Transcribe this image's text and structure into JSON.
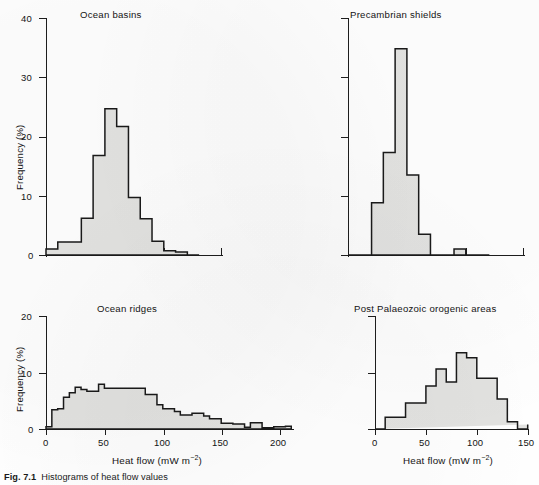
{
  "figure": {
    "caption_prefix": "Fig. 7.1",
    "caption_text": "Histograms of heat flow values",
    "y_axis_label": "Frequency (%)",
    "x_axis_label_main": "Heat flow (mW m",
    "x_axis_label_exp": "−2",
    "x_axis_label_close": ")"
  },
  "panels": [
    {
      "id": "ocean-basins",
      "title": "Ocean basins",
      "show_y_label": true,
      "show_x_label": false,
      "y_ticks": [
        {
          "value": 0,
          "label": "0"
        },
        {
          "value": 10,
          "label": "10"
        },
        {
          "value": 20,
          "label": "20"
        },
        {
          "value": 30,
          "label": "30"
        },
        {
          "value": 40,
          "label": "40"
        }
      ],
      "x_ticks": [
        {
          "value": 0,
          "label": ""
        },
        {
          "value": 50,
          "label": ""
        },
        {
          "value": 100,
          "label": ""
        },
        {
          "value": 150,
          "label": ""
        }
      ]
    },
    {
      "id": "precambrian-shields",
      "title": "Precambrian shields",
      "show_y_label": false,
      "show_x_label": false,
      "y_ticks": [
        {
          "value": 0,
          "label": ""
        },
        {
          "value": 10,
          "label": ""
        },
        {
          "value": 20,
          "label": ""
        },
        {
          "value": 30,
          "label": ""
        },
        {
          "value": 40,
          "label": ""
        }
      ],
      "x_ticks": [
        {
          "value": 0,
          "label": ""
        },
        {
          "value": 50,
          "label": ""
        },
        {
          "value": 100,
          "label": ""
        },
        {
          "value": 150,
          "label": ""
        }
      ]
    },
    {
      "id": "ocean-ridges",
      "title": "Ocean ridges",
      "show_y_label": true,
      "show_x_label": true,
      "y_ticks": [
        {
          "value": 0,
          "label": "0"
        },
        {
          "value": 10,
          "label": "10"
        },
        {
          "value": 20,
          "label": "20"
        }
      ],
      "x_ticks": [
        {
          "value": 0,
          "label": "0"
        },
        {
          "value": 50,
          "label": "50"
        },
        {
          "value": 100,
          "label": "100"
        },
        {
          "value": 150,
          "label": "150"
        },
        {
          "value": 200,
          "label": "200"
        }
      ]
    },
    {
      "id": "post-palaeozoic-orogenic-areas",
      "title": "Post Palaeozoic orogenic areas",
      "show_y_label": false,
      "show_x_label": true,
      "y_ticks": [
        {
          "value": 0,
          "label": ""
        },
        {
          "value": 10,
          "label": ""
        },
        {
          "value": 20,
          "label": ""
        }
      ],
      "x_ticks": [
        {
          "value": 0,
          "label": "0"
        },
        {
          "value": 50,
          "label": "50"
        },
        {
          "value": 100,
          "label": "100"
        },
        {
          "value": 150,
          "label": "150"
        }
      ]
    }
  ],
  "chart_data": [
    {
      "type": "bar",
      "id": "ocean-basins",
      "title": "Ocean basins",
      "xlabel": "Heat flow (mW m-2)",
      "ylabel": "Frequency (%)",
      "xlim": [
        0,
        190
      ],
      "ylim": [
        0,
        40
      ],
      "bin_width": 10,
      "bin_edges": [
        0,
        10,
        20,
        30,
        40,
        50,
        60,
        70,
        80,
        90,
        100,
        110,
        120,
        130
      ],
      "values": [
        1.0,
        2.2,
        2.2,
        6.2,
        16.8,
        24.7,
        21.7,
        9.7,
        6.1,
        2.3,
        0.7,
        0.5,
        0.0
      ],
      "grid": false,
      "legend": null
    },
    {
      "type": "bar",
      "id": "precambrian-shields",
      "title": "Precambrian shields",
      "xlabel": "Heat flow (mW m-2)",
      "ylabel": "Frequency (%)",
      "xlim": [
        0,
        150
      ],
      "ylim": [
        0,
        40
      ],
      "bin_width": 10,
      "bin_edges": [
        0,
        10,
        20,
        30,
        40,
        50,
        60,
        70,
        80,
        90,
        100,
        110,
        120
      ],
      "values": [
        0.0,
        0.0,
        8.8,
        17.3,
        34.8,
        13.5,
        3.5,
        0.0,
        0.0,
        1.0,
        0.0,
        0.0
      ],
      "grid": false,
      "legend": null
    },
    {
      "type": "bar",
      "id": "ocean-ridges",
      "title": "Ocean ridges",
      "xlabel": "Heat flow (mW m-2)",
      "ylabel": "Frequency (%)",
      "xlim": [
        0,
        215
      ],
      "ylim": [
        0,
        20
      ],
      "bin_width": 10,
      "bin_edges": [
        0,
        5,
        10,
        15,
        20,
        25,
        30,
        35,
        40,
        45,
        50,
        55,
        60,
        65,
        70,
        75,
        80,
        85,
        90,
        95,
        100,
        105,
        110,
        115,
        120,
        125,
        130,
        135,
        140,
        145,
        150,
        155,
        160,
        165,
        170,
        175,
        180,
        185,
        190,
        195,
        200,
        205,
        210
      ],
      "values": [
        0.4,
        3.4,
        3.6,
        5.6,
        6.4,
        7.4,
        7.0,
        6.7,
        6.7,
        7.9,
        7.2,
        7.2,
        7.2,
        7.2,
        7.2,
        7.2,
        7.2,
        6.1,
        6.1,
        4.3,
        3.6,
        3.6,
        3.1,
        2.5,
        2.5,
        2.8,
        2.8,
        2.3,
        1.8,
        1.8,
        1.0,
        1.0,
        0.9,
        0.9,
        0.3,
        1.1,
        1.1,
        0.2,
        0.2,
        0.4,
        0.4,
        0.5
      ],
      "grid": false,
      "legend": null
    },
    {
      "type": "bar",
      "id": "post-palaeozoic-orogenic-areas",
      "title": "Post Palaeozoic orogenic areas",
      "xlabel": "Heat flow (mW m-2)",
      "ylabel": "Frequency (%)",
      "xlim": [
        0,
        155
      ],
      "ylim": [
        0,
        20
      ],
      "bin_width": 10,
      "bin_edges": [
        0,
        10,
        20,
        30,
        40,
        50,
        60,
        70,
        80,
        90,
        100,
        110,
        120,
        130,
        140,
        150
      ],
      "values": [
        0.0,
        2.1,
        2.1,
        4.6,
        4.6,
        7.6,
        10.6,
        8.3,
        13.5,
        12.6,
        9.0,
        9.0,
        5.3,
        1.3,
        0.0,
        0.8
      ],
      "grid": false,
      "legend": null
    }
  ]
}
